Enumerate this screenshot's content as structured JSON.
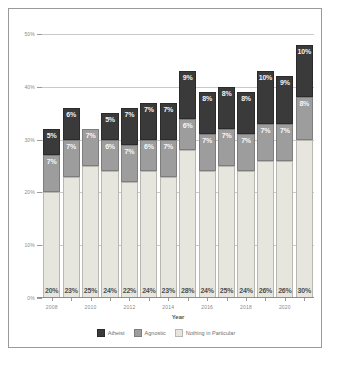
{
  "chart_data": {
    "type": "bar",
    "stacked": true,
    "title": "",
    "xlabel": "Year",
    "ylabel": "",
    "ylim": [
      0,
      50
    ],
    "ytick_labels": [
      "0%",
      "10%",
      "20%",
      "30%",
      "40%",
      "50%"
    ],
    "ytick_values": [
      0,
      10,
      20,
      30,
      40,
      50
    ],
    "grid": true,
    "legend_position": "bottom",
    "categories": [
      "2008",
      "2009",
      "2010",
      "2011",
      "2012",
      "2013",
      "2014",
      "2015",
      "2016",
      "2017",
      "2018",
      "2019",
      "2020",
      "2021"
    ],
    "xtick_labels_shown": [
      "2008",
      "2010",
      "2012",
      "2014",
      "2016",
      "2018",
      "2020"
    ],
    "series": [
      {
        "name": "Nothing in Particular",
        "color": "#e6e6de",
        "values": [
          20,
          23,
          25,
          24,
          22,
          24,
          23,
          28,
          24,
          25,
          24,
          26,
          26,
          30
        ],
        "labels": [
          "20%",
          "23%",
          "25%",
          "24%",
          "22%",
          "24%",
          "23%",
          "28%",
          "24%",
          "25%",
          "24%",
          "26%",
          "26%",
          "30%"
        ]
      },
      {
        "name": "Agnostic",
        "color": "#9d9d9d",
        "values": [
          7,
          7,
          7,
          6,
          7,
          6,
          7,
          6,
          7,
          7,
          7,
          7,
          7,
          8
        ],
        "labels": [
          "7%",
          "7%",
          "7%",
          "6%",
          "7%",
          "6%",
          "7%",
          "6%",
          "7%",
          "7%",
          "7%",
          "7%",
          "7%",
          "8%"
        ]
      },
      {
        "name": "Atheist",
        "color": "#3a3a3a",
        "values": [
          5,
          6,
          0,
          5,
          7,
          7,
          7,
          9,
          8,
          8,
          8,
          10,
          9,
          10
        ],
        "labels": [
          "5%",
          "6%",
          "",
          "5%",
          "7%",
          "7%",
          "7%",
          "9%",
          "8%",
          "8%",
          "8%",
          "10%",
          "9%",
          "10%"
        ]
      }
    ],
    "legend": [
      {
        "name": "Atheist",
        "color": "#3a3a3a"
      },
      {
        "name": "Agnostic",
        "color": "#9d9d9d"
      },
      {
        "name": "Nothing in Particular",
        "color": "#e6e6de"
      }
    ]
  }
}
